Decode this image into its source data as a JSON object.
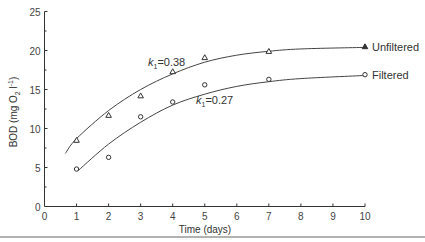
{
  "chart_data": {
    "type": "line",
    "title": "",
    "xlabel": "Time (days)",
    "ylabel": "BOD (mg O2 l-1)",
    "ylabel_parts": {
      "main": "BOD (mg O",
      "sub": "2",
      "mid": " l",
      "sup": "-1",
      "end": ")"
    },
    "xlim": [
      0,
      10
    ],
    "ylim": [
      0,
      25
    ],
    "xticks": [
      0,
      1,
      2,
      3,
      4,
      5,
      6,
      7,
      8,
      9,
      10
    ],
    "yticks": [
      0,
      5,
      10,
      15,
      20,
      25
    ],
    "grid": false,
    "series": [
      {
        "name": "Unfiltered",
        "marker": "triangle",
        "x": [
          1,
          2,
          3,
          4,
          5,
          7,
          10
        ],
        "values": [
          8.5,
          11.7,
          14.2,
          17.3,
          19.1,
          19.9,
          20.5
        ],
        "fit_label": "k1 = 0.38",
        "fit_k_text": "k",
        "fit_sub": "1",
        "fit_value": "=0.38",
        "fit_curve": [
          [
            0.65,
            6.8
          ],
          [
            1,
            8.7
          ],
          [
            2,
            12.3
          ],
          [
            3,
            15.0
          ],
          [
            4,
            17.0
          ],
          [
            5,
            18.5
          ],
          [
            6,
            19.4
          ],
          [
            7,
            19.9
          ],
          [
            8,
            20.2
          ],
          [
            10,
            20.4
          ]
        ]
      },
      {
        "name": "Filtered",
        "marker": "circle",
        "x": [
          1,
          2,
          3,
          4,
          5,
          7,
          10
        ],
        "values": [
          4.8,
          6.3,
          11.5,
          13.4,
          15.6,
          16.3,
          16.9
        ],
        "fit_label": "k1 = 0.27",
        "fit_k_text": "k",
        "fit_sub": "1",
        "fit_value": "=0.27",
        "fit_curve": [
          [
            1.05,
            4.6
          ],
          [
            2,
            8.0
          ],
          [
            3,
            10.8
          ],
          [
            4,
            13.0
          ],
          [
            5,
            14.4
          ],
          [
            6,
            15.4
          ],
          [
            7,
            16.0
          ],
          [
            8,
            16.4
          ],
          [
            10,
            16.8
          ]
        ]
      }
    ]
  }
}
